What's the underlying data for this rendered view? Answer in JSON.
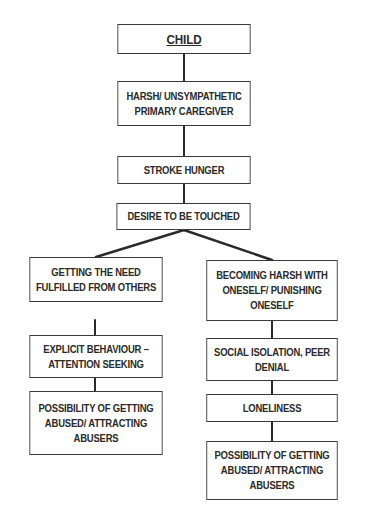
{
  "diagram": {
    "root": {
      "label": "CHILD"
    },
    "main_chain": [
      {
        "label": "HARSH/ UNSYMPATHETIC\nPRIMARY CAREGIVER"
      },
      {
        "label": "STROKE HUNGER"
      },
      {
        "label": "DESIRE TO BE TOUCHED"
      }
    ],
    "left_branch": [
      {
        "label": "GETTING THE NEED\nFULFILLED FROM OTHERS"
      },
      {
        "label": "EXPLICIT BEHAVIOUR –\nATTENTION SEEKING"
      },
      {
        "label": "POSSIBILITY OF GETTING\nABUSED/ ATTRACTING\nABUSERS"
      }
    ],
    "right_branch": [
      {
        "label": "BECOMING HARSH WITH\nONESELF/ PUNISHING\nONESELF"
      },
      {
        "label": "SOCIAL ISOLATION, PEER\nDENIAL"
      },
      {
        "label": "LONELINESS"
      },
      {
        "label": "POSSIBILITY OF GETTING\nABUSED/ ATTRACTING\nABUSERS"
      }
    ],
    "colors": {
      "border": "#3a3a3a",
      "text": "#2a2a2a",
      "background": "#ffffff"
    }
  }
}
